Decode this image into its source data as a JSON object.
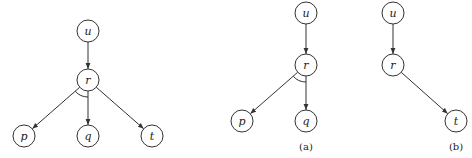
{
  "diagrams": [
    {
      "id": "full",
      "caption": "",
      "nodes": [
        {
          "id": "u",
          "label": "u",
          "x": 88,
          "y": 31
        },
        {
          "id": "r",
          "label": "r",
          "x": 88,
          "y": 80
        },
        {
          "id": "p",
          "label": "p",
          "x": 24,
          "y": 136
        },
        {
          "id": "q",
          "label": "q",
          "x": 88,
          "y": 136
        },
        {
          "id": "t",
          "label": "t",
          "x": 152,
          "y": 136
        }
      ],
      "edges": [
        [
          "u",
          "r"
        ],
        [
          "r",
          "p"
        ],
        [
          "r",
          "q"
        ],
        [
          "r",
          "t"
        ]
      ],
      "and_arc": {
        "at": "r",
        "between": [
          "p",
          "q"
        ]
      }
    },
    {
      "id": "a",
      "caption": "(a)",
      "caption_pos": {
        "x": 306,
        "y": 150
      },
      "nodes": [
        {
          "id": "u",
          "label": "u",
          "x": 306,
          "y": 13
        },
        {
          "id": "r",
          "label": "r",
          "x": 306,
          "y": 65
        },
        {
          "id": "p",
          "label": "p",
          "x": 242,
          "y": 121
        },
        {
          "id": "q",
          "label": "q",
          "x": 306,
          "y": 121
        }
      ],
      "edges": [
        [
          "u",
          "r"
        ],
        [
          "r",
          "p"
        ],
        [
          "r",
          "q"
        ]
      ],
      "and_arc": {
        "at": "r",
        "between": [
          "p",
          "q"
        ]
      }
    },
    {
      "id": "b",
      "caption": "(b)",
      "caption_pos": {
        "x": 456,
        "y": 150
      },
      "nodes": [
        {
          "id": "u",
          "label": "u",
          "x": 393,
          "y": 13
        },
        {
          "id": "r",
          "label": "r",
          "x": 393,
          "y": 65
        },
        {
          "id": "t",
          "label": "t",
          "x": 456,
          "y": 121
        }
      ],
      "edges": [
        [
          "u",
          "r"
        ],
        [
          "r",
          "t"
        ]
      ]
    }
  ],
  "style": {
    "node_radius": 11,
    "stroke": "#333333",
    "background": "#ffffff"
  }
}
